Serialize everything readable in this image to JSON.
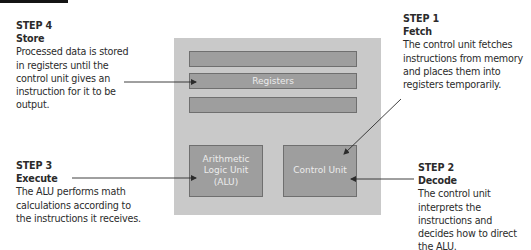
{
  "diagram": {
    "colors": {
      "cpu_box": "#c9c9c9",
      "component_fill": "#9e9e9e",
      "component_border": "#6f6f6f",
      "component_text": "#ececec",
      "arrow": "#2b2b2b",
      "text": "#2b2b2b"
    },
    "components": {
      "registers_label": "Registers",
      "alu_label": "Arithmetic Logic Unit (ALU)",
      "alu_lines": [
        "Arithmetic",
        "Logic Unit",
        "(ALU)"
      ],
      "control_unit_label": "Control Unit"
    },
    "steps": [
      {
        "number": "STEP 1",
        "name": "Fetch",
        "description": "The control unit fetches instructions from memory and places them into registers temporarily.",
        "points_to": "Control Unit"
      },
      {
        "number": "STEP 2",
        "name": "Decode",
        "description": "The control unit interprets the instructions and decides how to direct the ALU.",
        "points_to": "Control Unit"
      },
      {
        "number": "STEP 3",
        "name": "Execute",
        "description": "The ALU performs math calculations according to the instructions it receives.",
        "points_to": "Arithmetic Logic Unit (ALU)"
      },
      {
        "number": "STEP 4",
        "name": "Store",
        "description": "Processed data is stored in registers until the control unit gives an instruction for it to be output.",
        "points_to": "Registers"
      }
    ]
  }
}
